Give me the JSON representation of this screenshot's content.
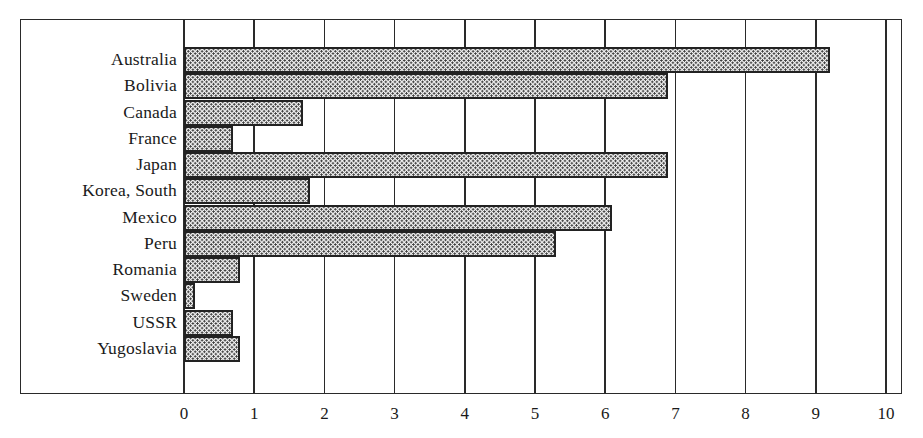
{
  "chart_data": {
    "type": "bar",
    "orientation": "horizontal",
    "title": "",
    "xlabel": "",
    "ylabel": "",
    "categories": [
      "Australia",
      "Bolivia",
      "Canada",
      "France",
      "Japan",
      "Korea, South",
      "Mexico",
      "Peru",
      "Romania",
      "Sweden",
      "USSR",
      "Yugoslavia"
    ],
    "values": [
      9.2,
      6.9,
      1.7,
      0.7,
      6.9,
      1.8,
      6.1,
      5.3,
      0.8,
      0.15,
      0.7,
      0.8
    ],
    "xlim": [
      0,
      10
    ],
    "x_ticks": [
      "0",
      "1",
      "2",
      "3",
      "4",
      "5",
      "6",
      "7",
      "8",
      "9",
      "10"
    ],
    "grid": "vertical lines at each integer tick",
    "legend": "none",
    "fill_pattern": "dotted stipple"
  },
  "colors": {
    "background": "#ffffff",
    "lines": "#2a2a2a",
    "bar_dots": "#3a3a3a",
    "bar_fill": "#f2f2f2"
  }
}
